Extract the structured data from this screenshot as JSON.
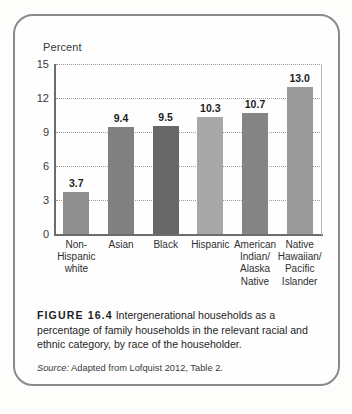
{
  "figure": {
    "tag": "FIGURE 16.4",
    "caption": "Intergenerational households as a percentage of family households in the relevant racial and ethnic category, by race of the householder.",
    "source_label": "Source:",
    "source_text": "Adapted from Lofquist 2012, Table 2."
  },
  "chart_data": {
    "type": "bar",
    "title": "",
    "xlabel": "",
    "ylabel": "Percent",
    "ylim": [
      0,
      15
    ],
    "yticks": [
      0,
      3,
      6,
      9,
      12,
      15
    ],
    "grid": true,
    "legend": "none",
    "categories": [
      "Non-\nHispanic\nwhite",
      "Asian",
      "Black",
      "Hispanic",
      "American\nIndian/\nAlaska\nNative",
      "Native\nHawaiian/\nPacific\nIslander"
    ],
    "values": [
      3.7,
      9.4,
      9.5,
      10.3,
      10.7,
      13.0
    ],
    "value_labels": [
      "3.7",
      "9.4",
      "9.5",
      "10.3",
      "10.7",
      "13.0"
    ],
    "bar_colors": [
      "#8f8f8f",
      "#808080",
      "#676767",
      "#a8a8a8",
      "#848484",
      "#9a9a9a"
    ]
  },
  "colors": {
    "frame_border": "#8a8a8a",
    "axis": "#6d6d6d",
    "gridline": "#9b9b9b",
    "background": "#fefefe",
    "text": "#1e1e1e"
  }
}
